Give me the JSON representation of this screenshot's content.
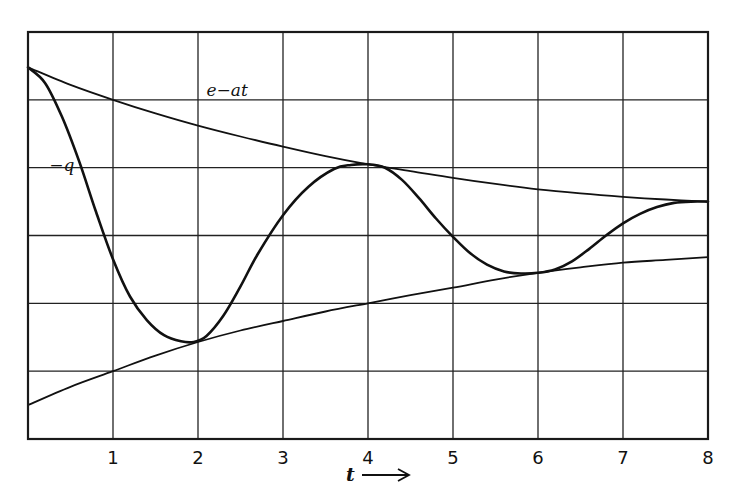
{
  "chart_data": {
    "type": "line",
    "title": "",
    "xlabel": "t",
    "xlabel_arrow": "→",
    "ylabel": "",
    "xlim": [
      0,
      8
    ],
    "ylim": [
      0,
      6
    ],
    "grid": true,
    "x_ticks": [
      1,
      2,
      3,
      4,
      5,
      6,
      7,
      8
    ],
    "x_tick_labels": [
      "1",
      "2",
      "3",
      "4",
      "5",
      "6",
      "7",
      "8"
    ],
    "y_tick_labels": [],
    "y_units_note": "y in grid-row units (0 = bottom frame, 6 = top frame); no y-axis labels shown",
    "legend": null,
    "annotations": [
      {
        "text": "e−at",
        "series": "upper_envelope",
        "x": 2.1,
        "y": 5.05
      },
      {
        "text": "−q",
        "series": "neg_q",
        "x": 0.25,
        "y": 3.95
      }
    ],
    "series": [
      {
        "name": "e−at",
        "role": "upper_envelope",
        "stroke_width": 1.8,
        "x": [
          0,
          0.5,
          1,
          1.5,
          2,
          2.5,
          3,
          3.5,
          4,
          4.5,
          5,
          5.5,
          6,
          6.5,
          7,
          7.5,
          8
        ],
        "y": [
          5.48,
          5.22,
          5.0,
          4.8,
          4.62,
          4.46,
          4.31,
          4.17,
          4.05,
          3.95,
          3.85,
          3.76,
          3.68,
          3.62,
          3.57,
          3.53,
          3.5
        ]
      },
      {
        "name": "lower envelope",
        "role": "lower_envelope",
        "stroke_width": 1.8,
        "x": [
          0,
          0.5,
          1,
          1.5,
          2,
          2.5,
          3,
          3.5,
          4,
          4.5,
          5,
          5.5,
          6,
          6.5,
          7,
          7.5,
          8
        ],
        "y": [
          0.5,
          0.77,
          1.0,
          1.23,
          1.43,
          1.6,
          1.74,
          1.88,
          2.0,
          2.12,
          2.23,
          2.35,
          2.45,
          2.53,
          2.6,
          2.64,
          2.68
        ]
      },
      {
        "name": "−q",
        "role": "response",
        "stroke_width": 2.6,
        "x": [
          0,
          0.2,
          0.4,
          0.6,
          0.8,
          1.0,
          1.2,
          1.4,
          1.6,
          1.8,
          1.95,
          2.1,
          2.3,
          2.5,
          2.7,
          3.0,
          3.3,
          3.6,
          3.8,
          4.0,
          4.2,
          4.4,
          4.6,
          4.8,
          5.0,
          5.2,
          5.4,
          5.6,
          5.8,
          6.0,
          6.2,
          6.4,
          6.6,
          6.8,
          7.0,
          7.2,
          7.4,
          7.6,
          7.8,
          8.0
        ],
        "y": [
          5.48,
          5.25,
          4.75,
          4.1,
          3.35,
          2.65,
          2.1,
          1.75,
          1.53,
          1.44,
          1.43,
          1.52,
          1.82,
          2.25,
          2.72,
          3.3,
          3.72,
          3.98,
          4.04,
          4.05,
          4.0,
          3.82,
          3.55,
          3.25,
          2.98,
          2.74,
          2.57,
          2.47,
          2.44,
          2.45,
          2.5,
          2.62,
          2.8,
          3.0,
          3.18,
          3.32,
          3.42,
          3.48,
          3.5,
          3.5
        ]
      }
    ]
  }
}
